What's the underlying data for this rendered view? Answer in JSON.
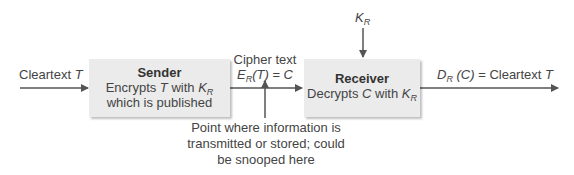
{
  "diagram": {
    "input_label": {
      "text": "Cleartext ",
      "var": "T"
    },
    "sender": {
      "title": "Sender",
      "line1_a": "Encrypts ",
      "line1_var": "T",
      "line1_b": " with ",
      "line1_key": "K",
      "line1_key_sub": "R",
      "line2": "which is published"
    },
    "cipher_label": {
      "line1": "Cipher text",
      "fn": "E",
      "fn_sub": "R",
      "arg": "(T)",
      "eq": " = ",
      "result": "C"
    },
    "key_label": {
      "key": "K",
      "key_sub": "R"
    },
    "receiver": {
      "title": "Receiver",
      "line1_a": "Decrypts ",
      "line1_var": "C",
      "line1_b": " with ",
      "line1_key": "K",
      "line1_key_sub": "R"
    },
    "output_label": {
      "fn": "D",
      "fn_sub": "R",
      "arg": " (C)",
      "eq": " = Cleartext ",
      "var": "T"
    },
    "note": {
      "line1": "Point where information is",
      "line2": "transmitted or stored; could",
      "line3": "be snooped here"
    },
    "colors": {
      "box_fill": "#ebebeb",
      "line": "#555555",
      "text": "#444444"
    }
  }
}
